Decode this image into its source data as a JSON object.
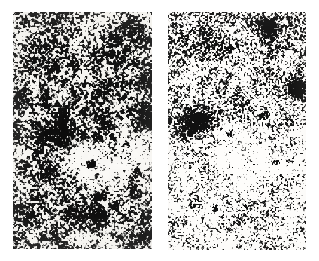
{
  "figure": {
    "kind": "astronomical-plate-pair",
    "medium": "halftone scan",
    "page_background": "#ffffff",
    "width": 319,
    "height": 261,
    "caption": "",
    "title": ""
  },
  "panels": [
    {
      "id": "left",
      "name": "left-plate",
      "label": "",
      "rect": {
        "x": 13,
        "y": 12,
        "w": 139,
        "h": 237
      },
      "seed": 20461,
      "grain": {
        "cell": 2.05,
        "base_density": 0.495,
        "contrast": 0.94,
        "ink": "#121212",
        "paper": "#f4f3f0",
        "blur_px": 0.45,
        "clumping": 0.62,
        "vertical_gradient": [
          0.5,
          0.52
        ]
      },
      "vignette": {
        "strength": 0.1,
        "edge": "#d8d6d2"
      },
      "features": [
        {
          "type": "star",
          "name": "bright-star-primary",
          "cx": 45,
          "cy": 122,
          "r": 15,
          "core_r": 6.5,
          "polarity": "dark",
          "strength": 1.0,
          "spikes": {
            "count": 4,
            "length": 17,
            "width": 3.4,
            "angle_deg": 20
          }
        },
        {
          "type": "star",
          "name": "bright-star-secondary",
          "cx": 140,
          "cy": 110,
          "r": 9,
          "core_r": 4.2,
          "polarity": "dark",
          "strength": 0.92,
          "spikes": {
            "count": 4,
            "length": 9,
            "width": 2.4,
            "angle_deg": 10
          }
        },
        {
          "type": "star",
          "name": "faint-star-upper",
          "cx": 101,
          "cy": 28,
          "r": 7,
          "core_r": 3.0,
          "polarity": "dark",
          "strength": 0.6,
          "spikes": {
            "count": 0,
            "length": 0,
            "width": 0,
            "angle_deg": 0
          }
        },
        {
          "type": "nebulosity",
          "name": "bright-diffuse-halo",
          "cx": 96,
          "cy": 150,
          "rx": 40,
          "ry": 28,
          "rot_deg": -16,
          "polarity": "bright",
          "strength": 0.95,
          "falloff": 1.55
        },
        {
          "type": "nebulosity",
          "name": "bright-halo-extension",
          "cx": 66,
          "cy": 139,
          "rx": 17,
          "ry": 12,
          "rot_deg": -30,
          "polarity": "bright",
          "strength": 0.55,
          "falloff": 1.7
        },
        {
          "type": "nebulosity",
          "name": "dark-lane-lower",
          "cx": 72,
          "cy": 206,
          "rx": 36,
          "ry": 17,
          "rot_deg": 8,
          "polarity": "dark",
          "strength": 0.22,
          "falloff": 1.8
        },
        {
          "type": "speck",
          "name": "field-speck-a",
          "cx": 78,
          "cy": 152,
          "r": 2.4,
          "polarity": "dark",
          "strength": 0.85
        },
        {
          "type": "speck",
          "name": "field-speck-b",
          "cx": 113,
          "cy": 132,
          "r": 2.0,
          "polarity": "dark",
          "strength": 0.75
        },
        {
          "type": "speck",
          "name": "field-speck-c",
          "cx": 124,
          "cy": 158,
          "r": 1.8,
          "polarity": "dark",
          "strength": 0.7
        }
      ]
    },
    {
      "id": "right",
      "name": "right-plate",
      "label": "",
      "rect": {
        "x": 168,
        "y": 12,
        "w": 138,
        "h": 238
      },
      "seed": 77312,
      "grain": {
        "cell": 1.75,
        "base_density": 0.325,
        "contrast": 0.99,
        "ink": "#161616",
        "paper": "#f7f6f4",
        "blur_px": 0.3,
        "clumping": 0.4,
        "vertical_gradient": [
          0.44,
          0.24
        ]
      },
      "vignette": {
        "strength": 0.06,
        "edge": "#dedcd8"
      },
      "features": [
        {
          "type": "star",
          "name": "bright-star-primary",
          "cx": 28,
          "cy": 110,
          "r": 14,
          "core_r": 6.0,
          "polarity": "dark",
          "strength": 1.0,
          "spikes": {
            "count": 4,
            "length": 16,
            "width": 3.2,
            "angle_deg": 25
          }
        },
        {
          "type": "star",
          "name": "bright-star-upper-right",
          "cx": 100,
          "cy": 16,
          "r": 9,
          "core_r": 4.0,
          "polarity": "dark",
          "strength": 0.9,
          "spikes": {
            "count": 4,
            "length": 8,
            "width": 2.2,
            "angle_deg": 0
          }
        },
        {
          "type": "star",
          "name": "bright-star-right-edge",
          "cx": 129,
          "cy": 76,
          "r": 8,
          "core_r": 3.6,
          "polarity": "dark",
          "strength": 0.85,
          "spikes": {
            "count": 4,
            "length": 7,
            "width": 2.0,
            "angle_deg": 15
          }
        },
        {
          "type": "nebulosity",
          "name": "bright-diffuse-halo",
          "cx": 74,
          "cy": 142,
          "rx": 42,
          "ry": 30,
          "rot_deg": -14,
          "polarity": "bright",
          "strength": 0.92,
          "falloff": 1.5
        },
        {
          "type": "nebulosity",
          "name": "bright-halo-lower",
          "cx": 60,
          "cy": 178,
          "rx": 30,
          "ry": 18,
          "rot_deg": 6,
          "polarity": "bright",
          "strength": 0.45,
          "falloff": 1.8
        },
        {
          "type": "speck",
          "name": "field-speck-a",
          "cx": 62,
          "cy": 121,
          "r": 2.2,
          "polarity": "dark",
          "strength": 0.8
        },
        {
          "type": "speck",
          "name": "field-speck-b",
          "cx": 96,
          "cy": 102,
          "r": 2.6,
          "polarity": "dark",
          "strength": 0.85
        },
        {
          "type": "speck",
          "name": "field-speck-c",
          "cx": 108,
          "cy": 150,
          "r": 1.9,
          "polarity": "dark",
          "strength": 0.7
        },
        {
          "type": "speck",
          "name": "field-speck-d",
          "cx": 46,
          "cy": 196,
          "r": 2.0,
          "polarity": "dark",
          "strength": 0.7
        }
      ]
    }
  ],
  "gutter": {
    "name": "panel-gutter",
    "x": 152,
    "width": 16,
    "color": "#ffffff"
  }
}
